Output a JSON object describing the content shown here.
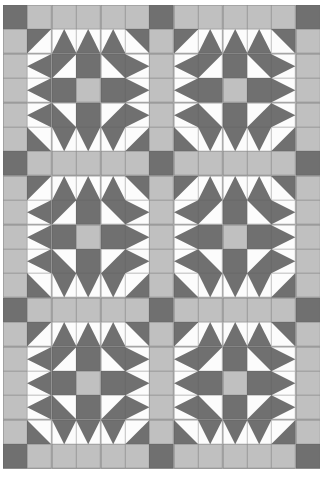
{
  "artwork": {
    "title": "Sawtooth Star Quilt Layout",
    "kind": "quilt-pattern-diagram",
    "width": 333,
    "height": 492,
    "grid_columns": 13,
    "grid_rows": 19,
    "cell_size": 24.4,
    "offset_x": 3,
    "offset_y": 5
  },
  "palette": {
    "dark": "#707070",
    "light": "#c0c0c0",
    "white": "#fcfcfc",
    "background": "#ffffff",
    "seam": "#5e5e5e"
  },
  "legend": {
    "dark_label": "Dark fabric",
    "light_label": "Medium fabric",
    "white_label": "Background fabric"
  },
  "layout": {
    "blocks_across": 2,
    "blocks_down": 3,
    "block_cells": 5,
    "sashing_label": "sashing",
    "cornerstone_label": "cornerstone"
  },
  "block_pattern": [
    [
      "hst-tl-d",
      "geese-up-d",
      "geese-up-d",
      "geese-up-d",
      "hst-tr-d"
    ],
    [
      "geese-left-d",
      "hst-tl-d",
      "solid-d",
      "hst-tr-d",
      "geese-right-d"
    ],
    [
      "geese-left-d",
      "solid-d",
      "solid-l",
      "solid-d",
      "geese-right-d"
    ],
    [
      "geese-left-d",
      "hst-bl-d",
      "solid-d",
      "hst-br-d",
      "geese-right-d"
    ],
    [
      "hst-bl-d",
      "geese-down-d",
      "geese-down-d",
      "geese-down-d",
      "hst-br-d"
    ]
  ],
  "row_kinds": [
    "sash",
    "block",
    "block",
    "block",
    "block",
    "block",
    "sash",
    "block",
    "block",
    "block",
    "block",
    "block",
    "sash",
    "block",
    "block",
    "block",
    "block",
    "block",
    "sash"
  ],
  "col_kinds": [
    "sash",
    "block",
    "block",
    "block",
    "block",
    "block",
    "sash",
    "block",
    "block",
    "block",
    "block",
    "block",
    "sash"
  ]
}
